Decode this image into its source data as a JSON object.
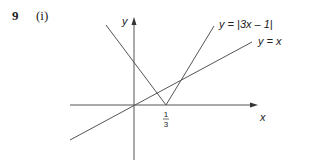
{
  "question": {
    "number": "9",
    "part": "(i)"
  },
  "graph": {
    "y_axis_label": "y",
    "x_axis_label": "x",
    "curve_abs_label": "y = |3x – 1|",
    "curve_line_label": "y = x",
    "tick_label_numerator": "1",
    "tick_label_denominator": "3",
    "line_color": "#555555"
  }
}
